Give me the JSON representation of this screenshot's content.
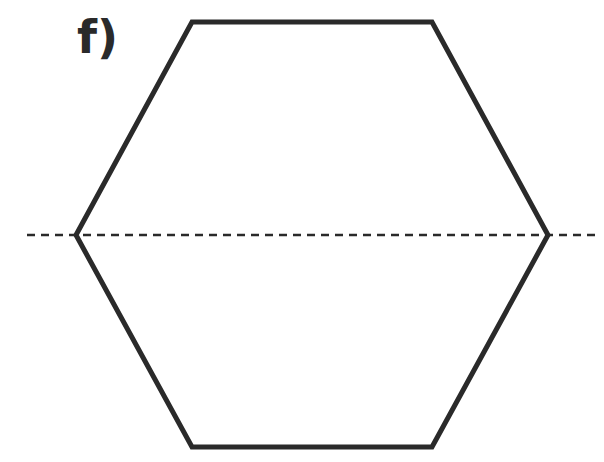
{
  "figure": {
    "label": "f)",
    "shape": "regular-hexagon",
    "line_color": "#2a2a2a",
    "axis_of_symmetry": "horizontal-dashed-line",
    "vertices": [
      [
        192,
        22
      ],
      [
        432,
        22
      ],
      [
        548,
        235
      ],
      [
        432,
        447
      ],
      [
        192,
        447
      ],
      [
        76,
        235
      ]
    ],
    "dashed_line": {
      "x1": 27,
      "y1": 235,
      "x2": 600,
      "y2": 235
    }
  }
}
